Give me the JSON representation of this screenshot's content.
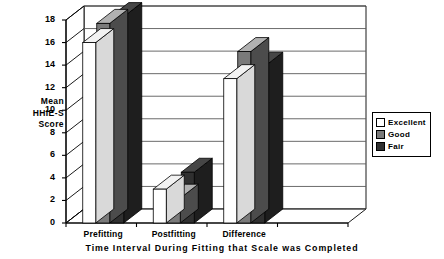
{
  "chart_data": {
    "type": "bar",
    "title": "",
    "subtitle": "",
    "xlabel": "Time Interval During Fitting that Scale was Completed",
    "ylabel": "Mean HHIE-S Score",
    "ylabel_lines": [
      "Mean",
      "HHIE-S",
      "Score"
    ],
    "categories": [
      "Prefitting",
      "Postfitting",
      "Difference"
    ],
    "series": [
      {
        "name": "Excellent",
        "color": "#ffffff",
        "values": [
          16.0,
          3.0,
          12.8
        ]
      },
      {
        "name": "Good",
        "color": "#7a7a7a",
        "values": [
          17.7,
          2.2,
          15.2
        ]
      },
      {
        "name": "Fair",
        "color": "#303030",
        "values": [
          18.3,
          4.5,
          13.9
        ]
      }
    ],
    "ylim": [
      0,
      18
    ],
    "yticks": [
      0,
      2,
      4,
      6,
      8,
      10,
      12,
      14,
      16,
      18
    ],
    "ytick_labels": [
      "0",
      "2",
      "4",
      "6",
      "8",
      "10",
      "12",
      "14",
      "16",
      "18"
    ],
    "grid": true,
    "grid_axis": "y",
    "legend_position": "right",
    "style": "3d-column",
    "axis_color": "#000000",
    "grid_color": "#5a5a5a",
    "background": "#ffffff"
  },
  "legend": {
    "entries": [
      {
        "label": "Excellent",
        "swatch": "white-swatch"
      },
      {
        "label": "Good",
        "swatch": "gray-swatch"
      },
      {
        "label": "Fair",
        "swatch": "dark-swatch"
      }
    ]
  }
}
